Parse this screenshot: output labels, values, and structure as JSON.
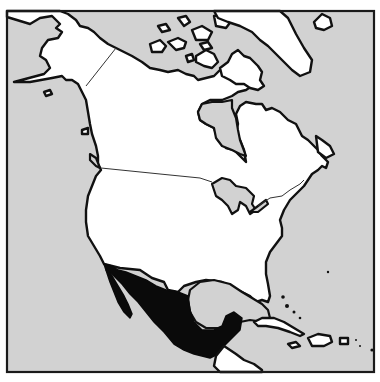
{
  "map": {
    "title": "",
    "region": "North America",
    "highlighted_country": "Mexico",
    "colors": {
      "ocean": "#d2d2d2",
      "land": "#ffffff",
      "highlight": "#0a0a0a",
      "outline": "#111111"
    },
    "features": [
      {
        "name": "Alaska",
        "style": "land"
      },
      {
        "name": "Canada",
        "style": "land"
      },
      {
        "name": "Greenland",
        "style": "land"
      },
      {
        "name": "Iceland",
        "style": "land"
      },
      {
        "name": "United States",
        "style": "land"
      },
      {
        "name": "Mexico",
        "style": "highlight"
      },
      {
        "name": "Central America",
        "style": "land"
      },
      {
        "name": "Cuba",
        "style": "land"
      },
      {
        "name": "Hispaniola",
        "style": "land"
      },
      {
        "name": "Hudson Bay",
        "style": "water"
      },
      {
        "name": "Great Lakes",
        "style": "water"
      },
      {
        "name": "Gulf of Mexico",
        "style": "water"
      }
    ]
  }
}
